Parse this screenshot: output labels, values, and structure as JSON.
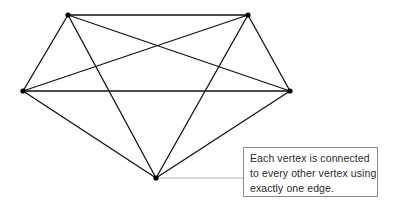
{
  "figure": {
    "background_color": "#ffffff",
    "edge_color": "#111111",
    "vertex_color": "#000000",
    "leader_line_color": "#b0b0b0",
    "callout_border_color": "#8a8a8a",
    "callout_text_color": "#2b2b2b"
  },
  "graph_data": {
    "type": "graph",
    "name": "K5",
    "vertex_count": 5,
    "edge_count": 10,
    "vertices": [
      {
        "id": "top-left",
        "label": "",
        "x": 68,
        "y": 15
      },
      {
        "id": "top-right",
        "label": "",
        "x": 248,
        "y": 15
      },
      {
        "id": "left",
        "label": "",
        "x": 23,
        "y": 91
      },
      {
        "id": "right",
        "label": "",
        "x": 290,
        "y": 91
      },
      {
        "id": "bottom",
        "label": "",
        "x": 156,
        "y": 178
      }
    ],
    "edges": [
      {
        "from": "top-left",
        "to": "top-right"
      },
      {
        "from": "top-left",
        "to": "left"
      },
      {
        "from": "top-left",
        "to": "right"
      },
      {
        "from": "top-left",
        "to": "bottom"
      },
      {
        "from": "top-right",
        "to": "left"
      },
      {
        "from": "top-right",
        "to": "right"
      },
      {
        "from": "top-right",
        "to": "bottom"
      },
      {
        "from": "left",
        "to": "right"
      },
      {
        "from": "left",
        "to": "bottom"
      },
      {
        "from": "right",
        "to": "bottom"
      }
    ]
  },
  "callout": {
    "anchor_vertex": "bottom",
    "leader": {
      "x1": 156,
      "y1": 178,
      "x2": 243,
      "y2": 178
    },
    "box": {
      "x": 243,
      "y": 147,
      "width": 135,
      "height": 50
    },
    "lines": [
      "Each vertex is connected",
      "to every other vertex using",
      "exactly one edge."
    ]
  }
}
